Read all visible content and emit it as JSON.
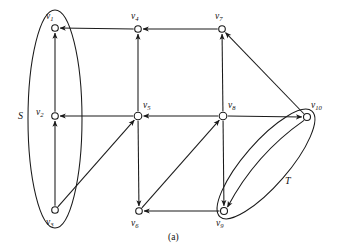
{
  "figure": {
    "caption": "(a)",
    "caption_pos": {
      "x": 168,
      "y": 233
    },
    "width": 344,
    "height": 250,
    "background": "#ffffff",
    "ink_color": "#1a1a1a"
  },
  "nodes": [
    {
      "id": "v1",
      "label": "v",
      "sub": "1",
      "x": 55,
      "y": 28,
      "r": 3.3,
      "label_x": 46,
      "label_y": 12
    },
    {
      "id": "v2",
      "label": "v",
      "sub": "2",
      "x": 55,
      "y": 116,
      "r": 3.3,
      "label_x": 36,
      "label_y": 108
    },
    {
      "id": "v3",
      "label": "v",
      "sub": "3",
      "x": 55,
      "y": 210,
      "r": 3.3,
      "label_x": 46,
      "label_y": 218
    },
    {
      "id": "v4",
      "label": "v",
      "sub": "4",
      "x": 138,
      "y": 29,
      "r": 3.3,
      "label_x": 131,
      "label_y": 12
    },
    {
      "id": "v5",
      "label": "v",
      "sub": "5",
      "x": 138,
      "y": 116,
      "r": 3.8,
      "label_x": 143,
      "label_y": 101
    },
    {
      "id": "v6",
      "label": "v",
      "sub": "6",
      "x": 139,
      "y": 211,
      "r": 3.3,
      "label_x": 131,
      "label_y": 219
    },
    {
      "id": "v7",
      "label": "v",
      "sub": "7",
      "x": 222,
      "y": 29,
      "r": 3.3,
      "label_x": 215,
      "label_y": 12
    },
    {
      "id": "v8",
      "label": "v",
      "sub": "8",
      "x": 223,
      "y": 116,
      "r": 3.8,
      "label_x": 228,
      "label_y": 101
    },
    {
      "id": "v9",
      "label": "v",
      "sub": "9",
      "x": 224,
      "y": 211,
      "r": 3.5,
      "label_x": 216,
      "label_y": 219
    },
    {
      "id": "v10",
      "label": "v",
      "sub": "10",
      "x": 307,
      "y": 117,
      "r": 3.5,
      "label_x": 311,
      "label_y": 101
    }
  ],
  "edges": [
    {
      "id": "e-v4-v1",
      "from": "v4",
      "to": "v1",
      "kind": "straight",
      "arrow": "head"
    },
    {
      "id": "e-v2-v1",
      "from": "v2",
      "to": "v1",
      "kind": "straight",
      "arrow": "head"
    },
    {
      "id": "e-v3-v2",
      "from": "v3",
      "to": "v2",
      "kind": "straight",
      "arrow": "head"
    },
    {
      "id": "e-v7-v4",
      "from": "v7",
      "to": "v4",
      "kind": "straight",
      "arrow": "head"
    },
    {
      "id": "e-v5-v4",
      "from": "v5",
      "to": "v4",
      "kind": "straight",
      "arrow": "head"
    },
    {
      "id": "e-v5-v2",
      "from": "v5",
      "to": "v2",
      "kind": "straight",
      "arrow": "head"
    },
    {
      "id": "e-v8-v5",
      "from": "v8",
      "to": "v5",
      "kind": "straight",
      "arrow": "head"
    },
    {
      "id": "e-v3-v5",
      "from": "v3",
      "to": "v5",
      "kind": "straight",
      "arrow": "head"
    },
    {
      "id": "e-v5-v6",
      "from": "v5",
      "to": "v6",
      "kind": "straight",
      "arrow": "head"
    },
    {
      "id": "e-v8-v7",
      "from": "v8",
      "to": "v7",
      "kind": "straight",
      "arrow": "head"
    },
    {
      "id": "e-v10-v7",
      "from": "v10",
      "to": "v7",
      "kind": "straight",
      "arrow": "head"
    },
    {
      "id": "e-v8-v10",
      "from": "v8",
      "to": "v10",
      "kind": "straight",
      "arrow": "head"
    },
    {
      "id": "e-v6-v8",
      "from": "v6",
      "to": "v8",
      "kind": "straight",
      "arrow": "head"
    },
    {
      "id": "e-v8-v9",
      "from": "v8",
      "to": "v9",
      "kind": "straight",
      "arrow": "head"
    },
    {
      "id": "e-v9-v6",
      "from": "v9",
      "to": "v6",
      "kind": "straight",
      "arrow": "head"
    },
    {
      "id": "e-v10-v9",
      "from": "v10",
      "to": "v9",
      "kind": "curve",
      "arrow": "head",
      "bow": 14
    }
  ],
  "groups": [
    {
      "id": "S",
      "label": "S",
      "label_x": 18,
      "label_y": 111,
      "cx": 55,
      "cy": 119,
      "rx": 27,
      "ry": 109,
      "rotate": 0,
      "members": [
        "v1",
        "v2",
        "v3"
      ]
    },
    {
      "id": "T",
      "label": "T",
      "label_x": 285,
      "label_y": 176,
      "cx": 266,
      "cy": 164,
      "rx": 70,
      "ry": 22,
      "rotate": -49,
      "members": [
        "v9",
        "v10"
      ]
    }
  ]
}
